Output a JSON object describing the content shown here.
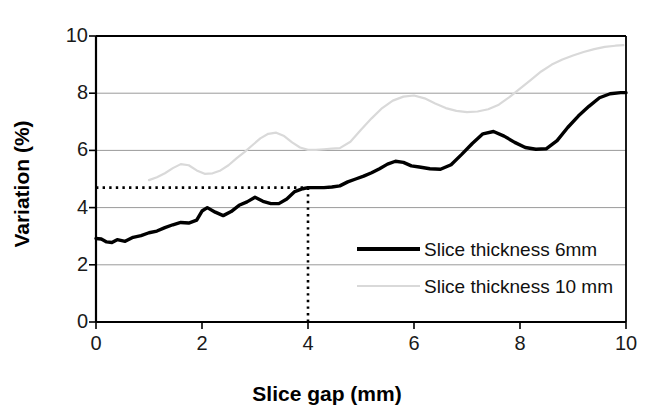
{
  "chart_data": {
    "type": "line",
    "title": "",
    "xlabel": "Slice gap (mm)",
    "ylabel": "Variation (%)",
    "xlim": [
      0,
      10
    ],
    "ylim": [
      0,
      10
    ],
    "xticks": [
      0,
      2,
      4,
      6,
      8,
      10
    ],
    "yticks": [
      0,
      2,
      4,
      6,
      8,
      10
    ],
    "xtick_labels": [
      "0",
      "2",
      "4",
      "6",
      "8",
      "10"
    ],
    "ytick_labels": [
      "0",
      "2",
      "4",
      "6",
      "8",
      "10"
    ],
    "grid": "horizontal",
    "legend_position": "inside-lower-right",
    "series": [
      {
        "name": "Slice thickness 6mm",
        "color": "#000000",
        "linewidth": 3.4,
        "x": [
          0.0,
          0.1,
          0.2,
          0.3,
          0.4,
          0.55,
          0.7,
          0.85,
          1.0,
          1.15,
          1.3,
          1.45,
          1.6,
          1.75,
          1.9,
          2.0,
          2.1,
          2.25,
          2.4,
          2.55,
          2.7,
          2.85,
          3.0,
          3.15,
          3.3,
          3.45,
          3.6,
          3.75,
          3.9,
          4.0,
          4.15,
          4.3,
          4.45,
          4.6,
          4.75,
          4.9,
          5.05,
          5.2,
          5.35,
          5.5,
          5.65,
          5.8,
          5.95,
          6.1,
          6.3,
          6.5,
          6.7,
          6.9,
          7.1,
          7.3,
          7.5,
          7.7,
          7.9,
          8.1,
          8.3,
          8.5,
          8.7,
          8.9,
          9.1,
          9.3,
          9.5,
          9.7,
          9.9,
          10.0
        ],
        "y": [
          2.92,
          2.9,
          2.8,
          2.78,
          2.88,
          2.82,
          2.96,
          3.02,
          3.12,
          3.18,
          3.3,
          3.4,
          3.48,
          3.46,
          3.56,
          3.88,
          4.0,
          3.84,
          3.72,
          3.86,
          4.08,
          4.2,
          4.36,
          4.22,
          4.14,
          4.14,
          4.3,
          4.56,
          4.66,
          4.7,
          4.7,
          4.7,
          4.72,
          4.76,
          4.9,
          5.0,
          5.1,
          5.22,
          5.36,
          5.52,
          5.62,
          5.58,
          5.46,
          5.42,
          5.36,
          5.34,
          5.5,
          5.86,
          6.24,
          6.58,
          6.66,
          6.5,
          6.28,
          6.1,
          6.04,
          6.06,
          6.34,
          6.8,
          7.2,
          7.54,
          7.84,
          7.98,
          8.02,
          8.02
        ]
      },
      {
        "name": "Slice thickness 10 mm",
        "color": "#d9d9d9",
        "linewidth": 2.2,
        "x": [
          1.0,
          1.15,
          1.3,
          1.45,
          1.6,
          1.75,
          1.9,
          2.05,
          2.2,
          2.35,
          2.5,
          2.65,
          2.8,
          2.95,
          3.1,
          3.25,
          3.4,
          3.55,
          3.7,
          3.85,
          4.0,
          4.15,
          4.3,
          4.45,
          4.6,
          4.8,
          5.0,
          5.2,
          5.4,
          5.6,
          5.8,
          6.0,
          6.2,
          6.4,
          6.6,
          6.8,
          7.0,
          7.2,
          7.4,
          7.6,
          7.8,
          8.0,
          8.2,
          8.4,
          8.6,
          8.8,
          9.0,
          9.2,
          9.4,
          9.6,
          9.8,
          9.95
        ],
        "y": [
          4.96,
          5.06,
          5.2,
          5.38,
          5.52,
          5.48,
          5.3,
          5.18,
          5.2,
          5.3,
          5.48,
          5.72,
          5.94,
          6.18,
          6.42,
          6.58,
          6.62,
          6.5,
          6.28,
          6.1,
          6.02,
          6.02,
          6.04,
          6.06,
          6.08,
          6.3,
          6.72,
          7.12,
          7.48,
          7.74,
          7.88,
          7.92,
          7.82,
          7.64,
          7.48,
          7.38,
          7.34,
          7.36,
          7.44,
          7.6,
          7.86,
          8.16,
          8.46,
          8.76,
          9.0,
          9.18,
          9.32,
          9.44,
          9.54,
          9.62,
          9.66,
          9.68
        ]
      }
    ],
    "annotations": [
      {
        "name": "guide-horizontal",
        "type": "dotted-line",
        "orientation": "horizontal",
        "value": 4.7,
        "from_x": 0,
        "to_x": 4.0,
        "color": "#000000"
      },
      {
        "name": "guide-vertical",
        "type": "dotted-line",
        "orientation": "vertical",
        "value": 4.0,
        "from_y": 0,
        "to_y": 4.7,
        "color": "#000000"
      }
    ],
    "legend": [
      {
        "label": "Slice thickness 6mm",
        "color": "#000000",
        "style": "thick-solid"
      },
      {
        "label": "Slice thickness 10 mm",
        "color": "#d9d9d9",
        "style": "thin-solid"
      }
    ]
  }
}
